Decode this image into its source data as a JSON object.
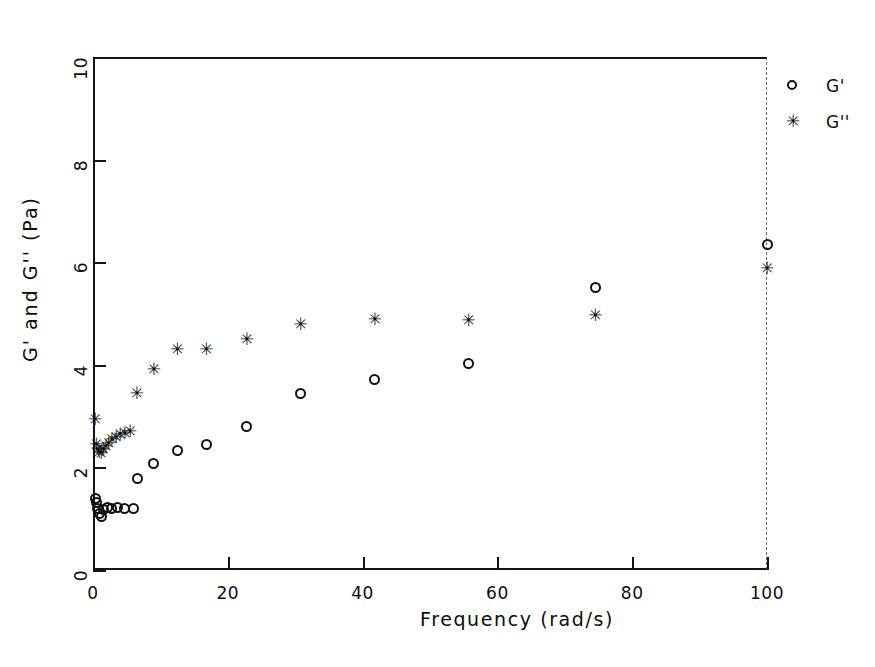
{
  "figure": {
    "background": "#ffffff",
    "ink": "#111111"
  },
  "legend": {
    "position": "right-outside",
    "entries": [
      {
        "marker": "open-circle",
        "label": "G'"
      },
      {
        "marker": "asterisk",
        "label": "G''"
      }
    ]
  },
  "chart_data": {
    "type": "scatter",
    "title": "",
    "xlabel": "Frequency (rad/s)",
    "ylabel": "G' and G'' (Pa)",
    "xlim": [
      0,
      100
    ],
    "ylim": [
      0,
      10
    ],
    "xticks": [
      0,
      20,
      40,
      60,
      80,
      100
    ],
    "yticks": [
      0,
      2,
      4,
      6,
      8,
      10
    ],
    "xtick_labels": [
      "0",
      "20",
      "40",
      "60",
      "80",
      "100"
    ],
    "ytick_labels": [
      "0",
      "2",
      "4",
      "6",
      "8",
      "10"
    ],
    "grid": false,
    "legend_position": "right",
    "series": [
      {
        "name": "G'",
        "marker": "open-circle",
        "color": "#111111",
        "points": [
          [
            0.3,
            1.4
          ],
          [
            0.5,
            1.32
          ],
          [
            0.7,
            1.2
          ],
          [
            0.9,
            1.1
          ],
          [
            1.2,
            1.05
          ],
          [
            1.6,
            1.18
          ],
          [
            2.1,
            1.22
          ],
          [
            2.8,
            1.2
          ],
          [
            3.6,
            1.22
          ],
          [
            4.6,
            1.2
          ],
          [
            6.0,
            1.2
          ],
          [
            6.6,
            1.78
          ],
          [
            9.0,
            2.07
          ],
          [
            12.5,
            2.33
          ],
          [
            16.8,
            2.45
          ],
          [
            22.8,
            2.8
          ],
          [
            30.8,
            3.45
          ],
          [
            41.8,
            3.72
          ],
          [
            55.7,
            4.02
          ],
          [
            74.5,
            5.5
          ],
          [
            100.0,
            6.35
          ]
        ]
      },
      {
        "name": "G''",
        "marker": "asterisk",
        "color": "#0a0a0a",
        "points": [
          [
            0.3,
            2.95
          ],
          [
            0.5,
            2.45
          ],
          [
            0.7,
            2.35
          ],
          [
            0.9,
            2.3
          ],
          [
            1.2,
            2.28
          ],
          [
            1.5,
            2.35
          ],
          [
            1.9,
            2.42
          ],
          [
            2.3,
            2.48
          ],
          [
            2.8,
            2.55
          ],
          [
            3.4,
            2.6
          ],
          [
            4.0,
            2.65
          ],
          [
            4.7,
            2.68
          ],
          [
            5.5,
            2.7
          ],
          [
            6.5,
            3.45
          ],
          [
            9.0,
            3.92
          ],
          [
            12.5,
            4.3
          ],
          [
            16.8,
            4.3
          ],
          [
            22.8,
            4.5
          ],
          [
            30.8,
            4.8
          ],
          [
            41.8,
            4.9
          ],
          [
            55.7,
            4.88
          ],
          [
            74.5,
            4.98
          ],
          [
            100.0,
            5.88
          ]
        ]
      }
    ]
  }
}
